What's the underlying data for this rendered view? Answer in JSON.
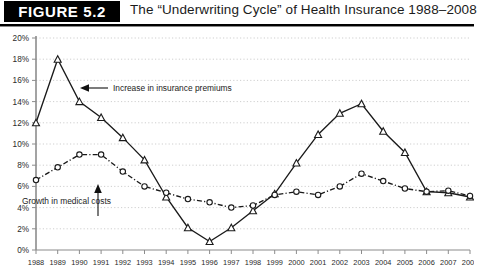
{
  "header": {
    "figure_label": "FIGURE 5.2",
    "title": "The “Underwriting Cycle” of Health Insurance 1988–2008"
  },
  "annotations": [
    {
      "id": "premiums",
      "text": "Increase in insurance premiums"
    },
    {
      "id": "medical",
      "text": "Growth in medical costs"
    }
  ],
  "colors": {
    "banner_bg": "#000000",
    "banner_text": "#ffffff",
    "series_premiums": "#1a1a1a",
    "series_medical": "#1a1a1a",
    "grid": "#c9c9c9",
    "axis": "#8c8c8c",
    "background": "#ffffff"
  },
  "chart_data": {
    "type": "line",
    "title": "The “Underwriting Cycle” of Health Insurance 1988–2008",
    "xlabel": "",
    "ylabel": "",
    "ylim": [
      0,
      20
    ],
    "ytick_labels": [
      "0%",
      "2%",
      "4%",
      "6%",
      "8%",
      "10%",
      "12%",
      "14%",
      "16%",
      "18%",
      "20%"
    ],
    "ytick_values": [
      0,
      2,
      4,
      6,
      8,
      10,
      12,
      14,
      16,
      18,
      20
    ],
    "grid": true,
    "legend": "annotated",
    "categories": [
      1988,
      1989,
      1990,
      1991,
      1992,
      1993,
      1994,
      1995,
      1996,
      1997,
      1998,
      1999,
      2000,
      2001,
      2002,
      2003,
      2004,
      2005,
      2006,
      2007,
      2008
    ],
    "xtick_labels": [
      "1988",
      "1989",
      "1990",
      "1991",
      "1992",
      "1993",
      "1994",
      "1995",
      "1996",
      "1997",
      "1998",
      "1999",
      "2000",
      "2001",
      "2002",
      "2003",
      "2004",
      "2005",
      "2006",
      "2007",
      "2008"
    ],
    "series": [
      {
        "name": "Increase in insurance premiums",
        "marker": "triangle",
        "line_style": "solid",
        "values": [
          12.0,
          18.0,
          14.0,
          12.5,
          10.6,
          8.5,
          5.0,
          2.1,
          0.8,
          2.1,
          3.7,
          5.3,
          8.2,
          10.9,
          12.9,
          13.8,
          11.2,
          9.2,
          5.5,
          5.4,
          5.0
        ]
      },
      {
        "name": "Growth in medical costs",
        "marker": "circle",
        "line_style": "dash-dot",
        "values": [
          6.6,
          7.8,
          9.0,
          9.0,
          7.4,
          6.0,
          5.4,
          4.8,
          4.5,
          4.0,
          4.2,
          5.2,
          5.5,
          5.2,
          6.0,
          7.2,
          6.5,
          5.8,
          5.5,
          5.6,
          5.1
        ]
      }
    ]
  }
}
